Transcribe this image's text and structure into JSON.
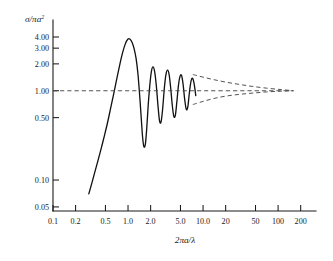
{
  "figure": {
    "name": "mie-scattering-efficiency-plot",
    "background_color": "#ffffff",
    "curve_color": "#111111",
    "dashed_color": "#4a4a4a",
    "axis_color": "#1a1a1a"
  },
  "labels": {
    "y_axis_title": "σ/πa",
    "y_axis_title_sup": "2",
    "x_axis_title": "2πa/λ"
  },
  "chart_data": {
    "type": "line",
    "title": "",
    "xlabel": "2πa/λ",
    "ylabel": "σ/πa²",
    "xscale": "log",
    "yscale": "log",
    "xlim": [
      0.1,
      320
    ],
    "ylim": [
      0.045,
      6.2
    ],
    "grid": false,
    "legend": "none",
    "xticks": [
      0.1,
      0.2,
      0.5,
      1.0,
      2.0,
      5.0,
      10.0,
      20,
      50,
      100,
      200
    ],
    "xticklabels": [
      "0.1",
      "0.2",
      "0.5",
      "1.0",
      "2.0",
      "5.0",
      "10.0",
      "20",
      "50",
      "100",
      "200"
    ],
    "yticks": [
      0.05,
      0.1,
      0.5,
      1.0,
      2.0,
      3.0,
      4.0
    ],
    "yticklabels": [
      "0.05",
      "0.10",
      "0.50",
      "1.00",
      "2.00",
      "3.00",
      "4.00"
    ],
    "series": [
      {
        "name": "extinction-efficiency",
        "style": "solid",
        "x": [
          0.3,
          0.33,
          0.36,
          0.4,
          0.44,
          0.48,
          0.53,
          0.58,
          0.64,
          0.7,
          0.77,
          0.84,
          0.92,
          1.0,
          1.06,
          1.13,
          1.2,
          1.28,
          1.36,
          1.45,
          1.55,
          1.62,
          1.7,
          1.78,
          1.86,
          1.95,
          2.05,
          2.15,
          2.26,
          2.38,
          2.5,
          2.63,
          2.76,
          2.9,
          3.05,
          3.2,
          3.36,
          3.53,
          3.7,
          3.88,
          4.07,
          4.27,
          4.48,
          4.7,
          4.93,
          5.17,
          5.42,
          5.69,
          5.97,
          6.26,
          6.57,
          6.9,
          7.24,
          7.6,
          8.0
        ],
        "y": [
          0.07,
          0.093,
          0.122,
          0.168,
          0.228,
          0.305,
          0.43,
          0.61,
          0.9,
          1.3,
          1.9,
          2.6,
          3.35,
          3.8,
          3.78,
          3.5,
          3.0,
          2.3,
          1.5,
          0.75,
          0.33,
          0.24,
          0.25,
          0.39,
          0.7,
          1.15,
          1.65,
          1.85,
          1.65,
          1.15,
          0.7,
          0.46,
          0.45,
          0.64,
          1.08,
          1.52,
          1.7,
          1.52,
          1.08,
          0.7,
          0.52,
          0.53,
          0.76,
          1.15,
          1.45,
          1.48,
          1.18,
          0.8,
          0.62,
          0.66,
          0.95,
          1.27,
          1.38,
          1.2,
          0.88
        ]
      },
      {
        "name": "upper-envelope",
        "style": "dashed",
        "x": [
          7.3,
          10,
          14,
          20,
          30,
          45,
          70,
          110,
          160
        ],
        "y": [
          1.52,
          1.42,
          1.33,
          1.25,
          1.18,
          1.12,
          1.07,
          1.03,
          1.0
        ]
      },
      {
        "name": "mean-asymptote",
        "style": "dashed",
        "x": [
          0.1,
          1,
          10,
          100,
          160
        ],
        "y": [
          1.0,
          1.0,
          1.0,
          1.0,
          1.0
        ]
      },
      {
        "name": "lower-envelope",
        "style": "dashed",
        "x": [
          7.3,
          10,
          14,
          20,
          30,
          45,
          70,
          110,
          160
        ],
        "y": [
          0.7,
          0.76,
          0.82,
          0.87,
          0.91,
          0.94,
          0.97,
          0.99,
          1.0
        ]
      }
    ]
  }
}
